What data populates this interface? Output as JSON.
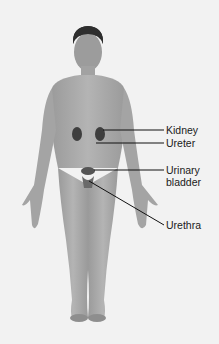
{
  "diagram": {
    "labels": [
      {
        "id": "kidney",
        "text": "Kidney"
      },
      {
        "id": "ureter",
        "text": "Ureter"
      },
      {
        "id": "bladder_line1",
        "text": "Urinary"
      },
      {
        "id": "bladder_line2",
        "text": "bladder"
      },
      {
        "id": "urethra",
        "text": "Urethra"
      }
    ],
    "colors": {
      "background": "#f2f2f2",
      "skin": "#a8a8a8",
      "organ": "#4a4a4a",
      "leader_line": "#111111"
    }
  }
}
